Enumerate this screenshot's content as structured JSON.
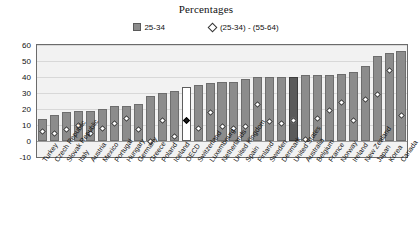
{
  "chart_data": {
    "type": "bar",
    "title": "Percentages",
    "xlabel": "",
    "ylabel": "",
    "ylim": [
      -10,
      60
    ],
    "yticks": [
      60,
      50,
      40,
      30,
      20,
      10,
      0,
      -10
    ],
    "grid": true,
    "legend_position": "top-center",
    "legend": [
      {
        "label": "25-34",
        "marker": "square",
        "color": "#8c8c8c"
      },
      {
        "label": "(25-34) - (55-64)",
        "marker": "diamond",
        "color": "#ffffff"
      }
    ],
    "categories": [
      "Turkey",
      "Czech Republic",
      "Slovak Republic",
      "Italy",
      "Austria",
      "Mexico",
      "Portugal",
      "Hungary",
      "Germany",
      "Greece",
      "Poland",
      "Iceland",
      "OECD",
      "Switzerland",
      "Luxembourg",
      "Netherlands",
      "United Kingdom",
      "Spain",
      "Finland",
      "Sweden",
      "Denmark",
      "United States",
      "Australia",
      "Belgium",
      "France",
      "Norway",
      "Ireland",
      "New Zealand",
      "Japan",
      "Korea",
      "Canada"
    ],
    "series": [
      {
        "name": "25-34",
        "values": [
          14,
          16,
          18,
          19,
          19,
          20,
          22,
          22,
          23,
          28,
          30,
          31,
          34,
          35,
          36,
          37,
          37,
          39,
          40,
          40,
          40,
          40,
          41,
          41,
          41,
          42,
          43,
          47,
          53,
          55,
          56
        ]
      },
      {
        "name": "(25-34) - (55-64)",
        "values": [
          6,
          5,
          7,
          10,
          5,
          8,
          11,
          14,
          7,
          0,
          13,
          3,
          13,
          8,
          18,
          9,
          8,
          9,
          23,
          12,
          11,
          13,
          1,
          14,
          19,
          24,
          13,
          26,
          29,
          44,
          16
        ]
      }
    ],
    "highlight_bars": [
      {
        "category": "OECD",
        "style": "white"
      },
      {
        "category": "United States",
        "style": "dark"
      }
    ]
  },
  "colors": {
    "bar": "#8c8c8c",
    "bar_border": "#6d6d6d",
    "bar_highlight_white": "#ffffff",
    "bar_highlight_dark": "#5a5a5a",
    "marker_fill": "#ffffff",
    "marker_border": "#3a3a3a",
    "plot_background": "#f2f2f2",
    "gridline": "#d8d8d8",
    "frame": "#6b6b6b",
    "text": "#111111"
  }
}
